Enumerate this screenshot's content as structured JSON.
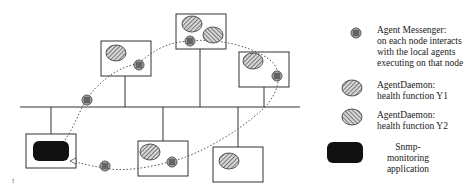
{
  "diagram": {
    "type": "network-topology",
    "bus": {
      "label": ""
    },
    "nodes": [
      {
        "id": "snmp-node",
        "contents": [
          "snmp-monitoring-app"
        ]
      },
      {
        "id": "node-1",
        "contents": [
          "agentdaemon-y1",
          "agent-messenger"
        ]
      },
      {
        "id": "node-2",
        "contents": [
          "agentdaemon-y1",
          "agentdaemon-y2",
          "agent-messenger"
        ]
      },
      {
        "id": "node-3",
        "contents": [
          "agentdaemon-y1",
          "agent-messenger"
        ]
      },
      {
        "id": "node-4",
        "contents": [
          "agentdaemon-y1",
          "agent-messenger"
        ]
      },
      {
        "id": "node-5",
        "contents": [
          "agentdaemon-y1"
        ]
      }
    ],
    "path": "dotted ring connecting agent messengers starting and ending at Snmp-monitoring application"
  },
  "legend": {
    "items": [
      {
        "icon": "agent-messenger-icon",
        "line1": "Agent Messenger:",
        "line2": "on each node interacts",
        "line3": "with the local agents",
        "line4": "executing on that node"
      },
      {
        "icon": "agentdaemon-y1-icon",
        "line1": "AgentDaemon:",
        "line2": "health function Y1"
      },
      {
        "icon": "agentdaemon-y2-icon",
        "line1": "AgentDaemon:",
        "line2": "health function Y2"
      },
      {
        "icon": "snmp-app-icon",
        "line1": "Snmp-monitoring",
        "line2": "application"
      }
    ]
  },
  "footnote_mark": "!"
}
